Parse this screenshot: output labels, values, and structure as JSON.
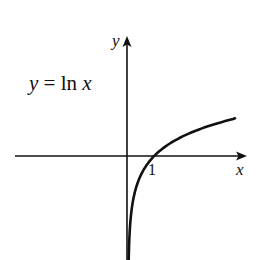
{
  "figure": {
    "equation": {
      "lhs": "y",
      "eq": " = ",
      "fn": "ln",
      "arg": "x"
    },
    "axes": {
      "x_label": "x",
      "y_label": "y"
    },
    "ticks": {
      "x": [
        "1"
      ]
    },
    "colors": {
      "ink": "#111111",
      "background": "#ffffff"
    }
  },
  "chart_data": {
    "type": "line",
    "title": "y = ln x",
    "xlabel": "x",
    "ylabel": "y",
    "function": "ln(x)",
    "x_ticks": [
      1
    ],
    "x": [
      0.05,
      0.1,
      0.2,
      0.3,
      0.5,
      0.75,
      1,
      1.5,
      2,
      2.5,
      3,
      3.5,
      4.15
    ],
    "values": [
      -3.0,
      -2.3,
      -1.61,
      -1.2,
      -0.69,
      -0.29,
      0,
      0.41,
      0.69,
      0.92,
      1.1,
      1.25,
      1.42
    ],
    "xlim": [
      -4.3,
      4.6
    ],
    "ylim": [
      -4.0,
      4.5
    ],
    "grid": false,
    "legend": "none"
  }
}
